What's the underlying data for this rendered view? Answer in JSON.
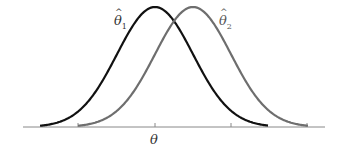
{
  "chart_data": {
    "type": "line",
    "title": "",
    "xlabel": "θ",
    "ylabel": "",
    "grid": false,
    "axis": {
      "y": 127,
      "x_start": 23,
      "x_end": 325,
      "ticks_px": [
        78,
        155,
        231,
        307
      ],
      "tick_labels": [
        "",
        "θ",
        "",
        ""
      ]
    },
    "series": [
      {
        "name": "θ̂1",
        "label_base": "θ",
        "label_sub": "1",
        "center_px": 155,
        "sigma_px": 38,
        "start_px": 40,
        "end_px": 268,
        "peak_height_px": 120,
        "color": "#111111",
        "description": "sampling distribution centered at true θ (unbiased)"
      },
      {
        "name": "θ̂2",
        "label_base": "θ",
        "label_sub": "2",
        "center_px": 193,
        "sigma_px": 38,
        "start_px": 78,
        "end_px": 308,
        "peak_height_px": 120,
        "color": "#6e6e6e",
        "description": "sampling distribution shifted right of θ (biased)"
      }
    ]
  },
  "labels": {
    "theta1": {
      "hat": "^",
      "base": "θ",
      "sub": "1"
    },
    "theta2": {
      "hat": "^",
      "base": "θ",
      "sub": "2"
    },
    "axis_theta": "θ"
  },
  "colors": {
    "curve1": "#111111",
    "curve2": "#6e6e6e",
    "axis": "#777777",
    "text": "#333333"
  }
}
